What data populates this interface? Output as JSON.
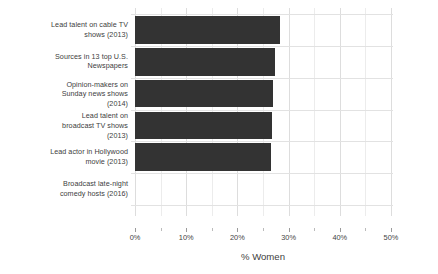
{
  "chart_data": {
    "type": "bar",
    "orientation": "horizontal",
    "title": "",
    "xlabel": "% Women",
    "ylabel": "",
    "xlim": [
      0,
      50
    ],
    "xticks": [
      "0%",
      "10%",
      "20%",
      "30%",
      "40%",
      "50%"
    ],
    "xtick_values": [
      0,
      10,
      20,
      30,
      40,
      50
    ],
    "minor_tick_values": [
      5,
      15,
      25,
      35,
      45
    ],
    "grid": true,
    "legend": false,
    "bar_color": "#333333",
    "grid_color": "#dddddd",
    "categories": [
      "Lead talent on cable TV\nshows (2013)",
      "Sources in 13 top U.S.\nNewspapers",
      "Opinion-makers on\nSunday news shows\n(2014)",
      "Lead talent on\nbroadcast TV shows\n(2013)",
      "Lead actor in Hollywood\nmovie (2013)",
      "Broadcast late-night\ncomedy hosts (2016)"
    ],
    "values": [
      28.3,
      27.3,
      27.0,
      26.7,
      26.5,
      0
    ]
  }
}
